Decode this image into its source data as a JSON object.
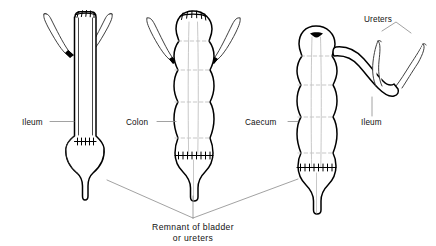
{
  "figure": {
    "background_color": "#ffffff",
    "ink_color": "#000000",
    "leader_color": "#8a8a8a",
    "haustra_color": "#b9b9b9",
    "width": 436,
    "height": 246
  },
  "labels": {
    "ileum_left": "Ileum",
    "colon_middle": "Colon",
    "caecum_right": "Caecum",
    "ureters_top_right": "Ureters",
    "ileum_right": "Ileum"
  },
  "caption": {
    "line1": "Remnant of bladder",
    "line2": "or ureters"
  },
  "panels": [
    {
      "id": "panel-ileal-conduit",
      "name": "ileal-conduit",
      "label": "Ileum",
      "features": [
        "ureters-anastomosed-both-sides",
        "suture-line-top",
        "suture-line-bladder-remnant",
        "bladder-remnant-bulb"
      ]
    },
    {
      "id": "panel-colonic-conduit",
      "name": "colonic-conduit",
      "label": "Colon",
      "features": [
        "haustrations",
        "taeniae-coli",
        "ureters-anastomosed-both-sides",
        "suture-line-top",
        "suture-line-lower",
        "bladder-remnant"
      ]
    },
    {
      "id": "panel-caecal-conduit",
      "name": "caecal-conduit",
      "label": "Caecum",
      "features": [
        "haustrations",
        "taeniae-coli",
        "ileal-segment-to-ureters",
        "closed-stump-top",
        "suture-line-lower",
        "bladder-remnant"
      ]
    }
  ]
}
